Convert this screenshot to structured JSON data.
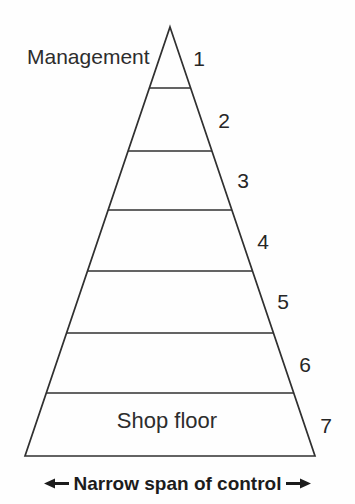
{
  "diagram": {
    "top_label": "Management",
    "bottom_label": "Shop floor",
    "levels": [
      {
        "number": "1"
      },
      {
        "number": "2"
      },
      {
        "number": "3"
      },
      {
        "number": "4"
      },
      {
        "number": "5"
      },
      {
        "number": "6"
      },
      {
        "number": "7"
      }
    ],
    "caption": "Narrow span of control",
    "icons": {
      "left_arrow": "left-arrow-icon",
      "right_arrow": "right-arrow-icon"
    },
    "colors": {
      "line": "#303030",
      "text": "#2a2a2a",
      "caption_text": "#1c1c1c",
      "background": "#fefefe"
    }
  }
}
